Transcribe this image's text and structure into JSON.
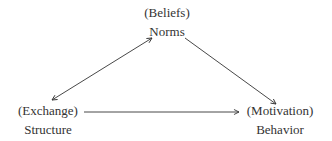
{
  "diagram": {
    "nodes": {
      "top": {
        "qualifier": "(Beliefs)",
        "label": "Norms"
      },
      "left": {
        "qualifier": "(Exchange)",
        "label": "Structure"
      },
      "right": {
        "qualifier": "(Motivation)",
        "label": "Behavior"
      }
    },
    "edges": [
      {
        "from": "Structure",
        "to": "Norms",
        "direction": "bidirectional"
      },
      {
        "from": "Norms",
        "to": "Behavior",
        "direction": "forward"
      },
      {
        "from": "Structure",
        "to": "Behavior",
        "direction": "forward"
      }
    ],
    "colors": {
      "stroke": "#333333",
      "text": "#333333"
    }
  }
}
